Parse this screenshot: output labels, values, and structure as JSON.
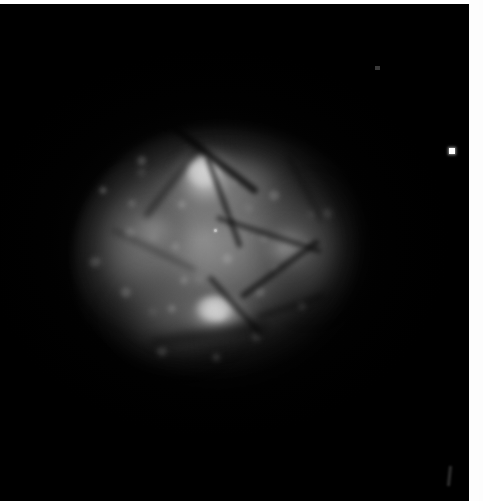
{
  "figure": {
    "kind": "astronomical-image",
    "modality": "grayscale intensity map",
    "caption": "",
    "width_px": 483,
    "height_px": 501,
    "background_color": "#000000",
    "page_color": "#ffffff"
  },
  "field": {
    "label": "sky-field",
    "left_px": 0,
    "top_px": 4,
    "width_px": 469,
    "height_px": 497,
    "color": "#000000"
  },
  "nebula": {
    "label": "nebula",
    "center_x_px": 215,
    "center_y_px": 248,
    "extent_x_px": [
      75,
      368
    ],
    "extent_y_px": [
      124,
      378
    ],
    "position_angle_deg": -9,
    "peak_gray": "#ffffff",
    "mid_gray": "#9a9a9a",
    "faint_gray": "#2e2e2e",
    "texture": "granular clumps with dark filamentary dust lanes",
    "components": [
      {
        "name": "halo",
        "cx": 220,
        "cy": 250,
        "rx": 165,
        "ry": 145,
        "peak_gray": "#969696"
      },
      {
        "name": "main-body",
        "cx": 218,
        "cy": 248,
        "rx": 146,
        "ry": 126,
        "peak_gray": "#cdcdcd"
      },
      {
        "name": "left-lobe",
        "cx": 127,
        "cy": 247,
        "rx": 65,
        "ry": 82,
        "peak_gray": "#a0a0a0"
      },
      {
        "name": "right-lobe",
        "cx": 319,
        "cy": 247,
        "rx": 57,
        "ry": 75,
        "peak_gray": "#969696"
      },
      {
        "name": "lower-left-extension",
        "cx": 171,
        "cy": 325,
        "rx": 75,
        "ry": 57,
        "peak_gray": "#8c8c8c"
      },
      {
        "name": "upper-ridge",
        "cx": 227,
        "cy": 175,
        "rx": 87,
        "ry": 47,
        "peak_gray": "#c3c3c3"
      }
    ]
  },
  "knots": [
    {
      "name": "knot-primary",
      "cx": 207,
      "cy": 177,
      "rx": 39,
      "ry": 37,
      "peak_gray": "#ffffff",
      "rank": 1
    },
    {
      "name": "knot-secondary",
      "cx": 221,
      "cy": 308,
      "rx": 43,
      "ry": 28,
      "peak_gray": "#ffffff",
      "rank": 2
    },
    {
      "name": "knot-right",
      "cx": 288,
      "cy": 244,
      "rx": 36,
      "ry": 32,
      "peak_gray": "#d8d8d8",
      "rank": 3
    },
    {
      "name": "knot-left",
      "cx": 153,
      "cy": 227,
      "rx": 35,
      "ry": 31,
      "peak_gray": "#cdcdcd",
      "rank": 4
    }
  ],
  "dust_lanes": [
    {
      "name": "lane-1",
      "x": 150,
      "y": 148,
      "length": 120,
      "angle_deg": 38,
      "opacity": 0.78
    },
    {
      "name": "lane-2",
      "x": 176,
      "y": 196,
      "length": 96,
      "angle_deg": 70,
      "opacity": 0.7
    },
    {
      "name": "lane-3",
      "x": 214,
      "y": 228,
      "length": 110,
      "angle_deg": 18,
      "opacity": 0.62
    },
    {
      "name": "lane-4",
      "x": 232,
      "y": 262,
      "length": 96,
      "angle_deg": -36,
      "opacity": 0.66
    },
    {
      "name": "lane-5",
      "x": 128,
      "y": 176,
      "length": 88,
      "angle_deg": -52,
      "opacity": 0.58
    },
    {
      "name": "lane-6",
      "x": 196,
      "y": 300,
      "length": 80,
      "angle_deg": 48,
      "opacity": 0.62
    },
    {
      "name": "lane-7",
      "x": 256,
      "y": 300,
      "length": 70,
      "angle_deg": -18,
      "opacity": 0.55
    },
    {
      "name": "lane-8",
      "x": 108,
      "y": 244,
      "length": 92,
      "angle_deg": 26,
      "opacity": 0.42
    },
    {
      "name": "lane-9",
      "x": 268,
      "y": 182,
      "length": 74,
      "angle_deg": 62,
      "opacity": 0.46
    },
    {
      "name": "lane-10",
      "x": 150,
      "y": 326,
      "length": 120,
      "angle_deg": -8,
      "opacity": 0.52
    }
  ],
  "point_sources": [
    {
      "name": "isolated-star",
      "cx": 452,
      "cy": 151,
      "size_px": 6,
      "gray": "#ffffff",
      "shape": "square"
    },
    {
      "name": "core-point",
      "cx": 215,
      "cy": 230,
      "size_px": 3,
      "gray": "#ffffff",
      "shape": "round"
    },
    {
      "name": "faint-speck-ur",
      "cx": 377,
      "cy": 68,
      "size_px": 5,
      "gray": "#3c3c3c",
      "shape": "square"
    },
    {
      "name": "faint-streak-br",
      "cx": 449,
      "cy": 472,
      "size_px": 20,
      "gray": "#343434",
      "shape": "streak"
    }
  ],
  "margins": {
    "top_label": "top-margin",
    "right_label": "right-margin",
    "top_px": 4,
    "right_px": 14,
    "color": "#ffffff"
  },
  "accessibility": {
    "alt_text": "Grayscale astronomical image: a bright, clumpy, roughly elliptical nebula with filamentary dark lanes centered slightly left of middle on a black sky field, with one isolated bright point source near the right edge."
  }
}
